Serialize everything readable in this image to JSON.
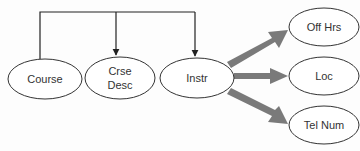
{
  "diagram": {
    "type": "tree",
    "colors": {
      "line": "#222222",
      "thick_arrow": "#777777",
      "node_stroke": "#333333",
      "node_fill": "#ffffff"
    },
    "nodes": [
      {
        "id": "course",
        "label": "Course",
        "lines": [
          "Course"
        ]
      },
      {
        "id": "crse_desc",
        "label": "Crse Desc",
        "lines": [
          "Crse",
          "Desc"
        ]
      },
      {
        "id": "instr",
        "label": "Instr",
        "lines": [
          "Instr"
        ]
      },
      {
        "id": "off_hrs",
        "label": "Off Hrs",
        "lines": [
          "Off Hrs"
        ]
      },
      {
        "id": "loc",
        "label": "Loc",
        "lines": [
          "Loc"
        ]
      },
      {
        "id": "tel_num",
        "label": "Tel Num",
        "lines": [
          "Tel Num"
        ]
      }
    ],
    "edges": [
      {
        "from": "course",
        "to": "crse_desc",
        "style": "thin-arrow"
      },
      {
        "from": "course",
        "to": "instr",
        "style": "thin-arrow"
      },
      {
        "from": "instr",
        "to": "off_hrs",
        "style": "thick-arrow"
      },
      {
        "from": "instr",
        "to": "loc",
        "style": "thick-arrow"
      },
      {
        "from": "instr",
        "to": "tel_num",
        "style": "thick-arrow"
      }
    ]
  }
}
